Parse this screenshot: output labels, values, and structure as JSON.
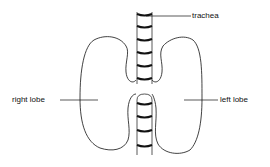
{
  "diagram": {
    "title": "",
    "labels": {
      "trachea": "trachea",
      "right_lobe": "right lobe",
      "left_lobe": "left lobe"
    },
    "colors": {
      "stroke": "#111111",
      "background": "#ffffff"
    }
  }
}
